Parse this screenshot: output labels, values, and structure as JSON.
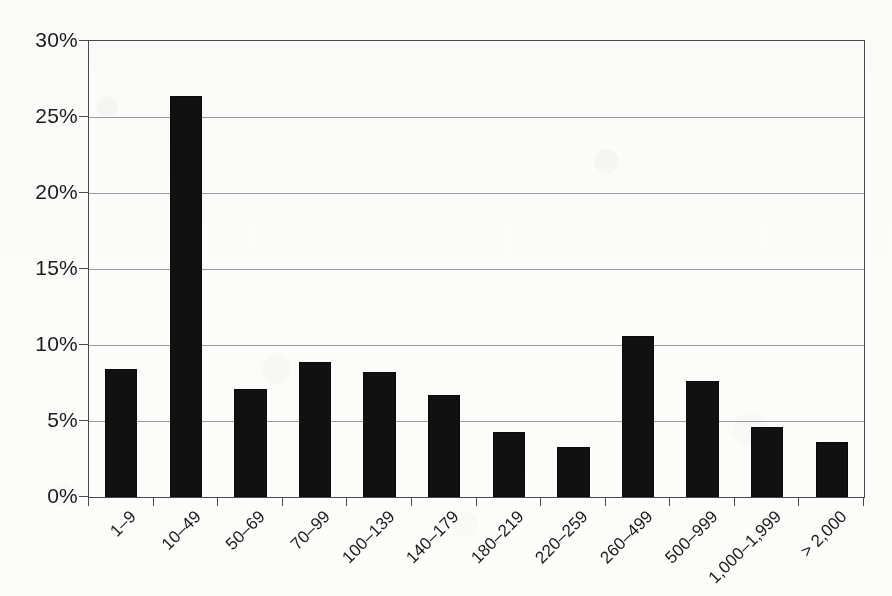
{
  "chart_data": {
    "type": "bar",
    "title": "",
    "subtitle": "",
    "xlabel": "",
    "ylabel": "",
    "categories": [
      "1–9",
      "10–49",
      "50–69",
      "70–99",
      "100–139",
      "140–179",
      "180–219",
      "220–259",
      "260–499",
      "500–999",
      "1,000–1,999",
      "> 2,000"
    ],
    "values": [
      8.4,
      26.4,
      7.1,
      8.9,
      8.2,
      6.7,
      4.3,
      3.3,
      10.6,
      7.6,
      4.6,
      3.6
    ],
    "value_labels": [
      "8.4%",
      "26.4%",
      "7.1%",
      "8.9%",
      "8.2%",
      "6.7%",
      "4.3%",
      "3.3%",
      "10.6%",
      "7.6%",
      "4.6%",
      "3.6%"
    ],
    "ylim": [
      0,
      30
    ],
    "ytick_values": [
      0,
      5,
      10,
      15,
      20,
      25,
      30
    ],
    "ytick_labels": [
      "0%",
      "5%",
      "10%",
      "15%",
      "20%",
      "25%",
      "30%"
    ],
    "grid": true,
    "grid_axis": "y",
    "legend": false,
    "legend_position": "none",
    "bar_color": "#111111",
    "grid_color": "#9a9a9a",
    "axis_color": "#4a4a4a",
    "background_color": "#fdfdfc",
    "tick_position": "between-categories",
    "xtick_label_rotation": -45
  }
}
